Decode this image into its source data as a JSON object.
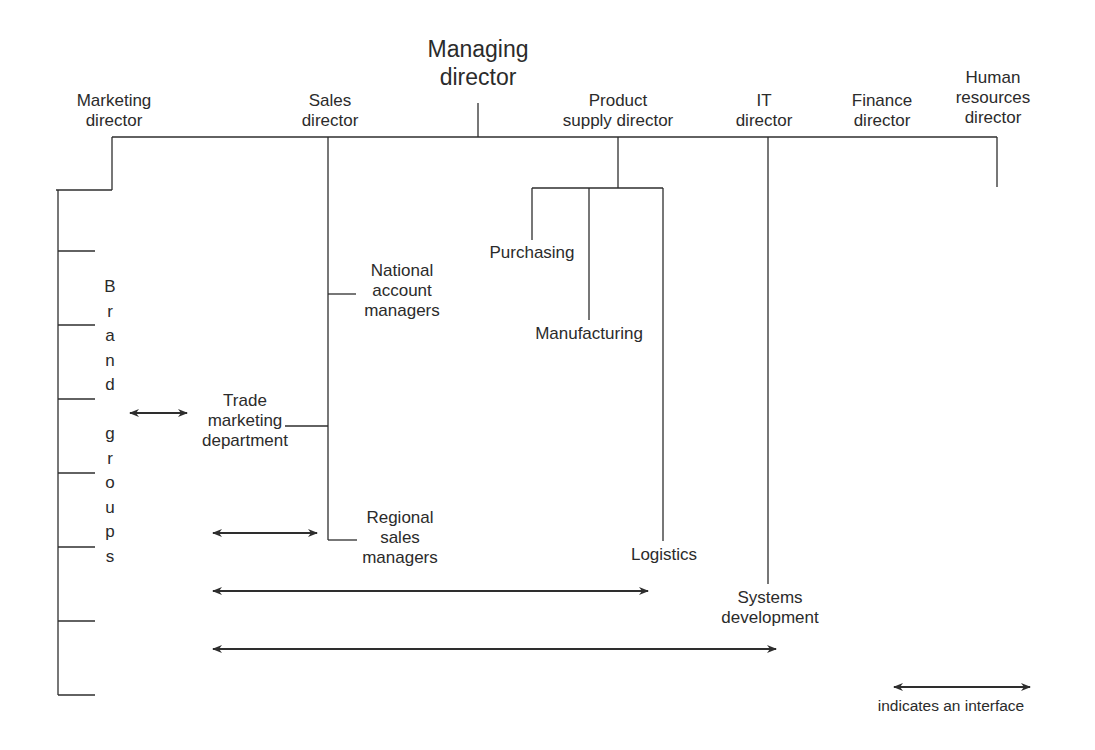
{
  "diagram": {
    "top": {
      "lines": [
        "Managing",
        "director"
      ]
    },
    "directors": [
      {
        "id": "marketing",
        "lines": [
          "Marketing",
          "director"
        ]
      },
      {
        "id": "sales",
        "lines": [
          "Sales",
          "director"
        ]
      },
      {
        "id": "product_supply",
        "lines": [
          "Product",
          "supply director"
        ]
      },
      {
        "id": "it",
        "lines": [
          "IT",
          "director"
        ]
      },
      {
        "id": "finance",
        "lines": [
          "Finance",
          "director"
        ]
      },
      {
        "id": "hr",
        "lines": [
          "Human",
          "resources",
          "director"
        ]
      }
    ],
    "marketing_units": {
      "brand_groups_letters": [
        "B",
        "r",
        "a",
        "n",
        "d",
        "",
        "g",
        "r",
        "o",
        "u",
        "p",
        "s"
      ],
      "trade_marketing": [
        "Trade",
        "marketing",
        "department"
      ]
    },
    "sales_units": {
      "national_accounts": [
        "National",
        "account",
        "managers"
      ],
      "regional_sales": [
        "Regional",
        "sales",
        "managers"
      ]
    },
    "product_supply_units": {
      "purchasing": "Purchasing",
      "manufacturing": "Manufacturing",
      "logistics": "Logistics"
    },
    "it_units": {
      "systems_development": [
        "Systems",
        "development"
      ]
    },
    "legend": {
      "text": "indicates an interface"
    },
    "colors": {
      "line": "#2e2e2e",
      "text": "#2b2b2b",
      "background": "#ffffff"
    }
  }
}
